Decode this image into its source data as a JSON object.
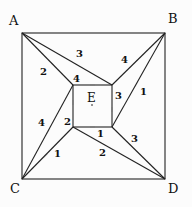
{
  "diagram": {
    "vertices": {
      "A": {
        "label": "A",
        "x": 22,
        "y": 33
      },
      "B": {
        "label": "B",
        "x": 165,
        "y": 33
      },
      "C": {
        "label": "C",
        "x": 22,
        "y": 179
      },
      "D": {
        "label": "D",
        "x": 165,
        "y": 179
      },
      "TL": {
        "x": 73,
        "y": 85
      },
      "TR": {
        "x": 112,
        "y": 85
      },
      "BL": {
        "x": 73,
        "y": 127
      },
      "BR": {
        "x": 112,
        "y": 127
      }
    },
    "center_label": "E",
    "edges": [
      {
        "from": "A",
        "to": "TL",
        "label": "2"
      },
      {
        "from": "TR",
        "to": "A",
        "label": "3"
      },
      {
        "from": "B",
        "to": "TR",
        "label": "4"
      },
      {
        "from": "BR",
        "to": "B",
        "label": "1"
      },
      {
        "from": "TL",
        "to": "C",
        "label": "4"
      },
      {
        "from": "C",
        "to": "BL",
        "label": "1"
      },
      {
        "from": "BL",
        "to": "D",
        "label": "2"
      },
      {
        "from": "D",
        "to": "BR",
        "label": "3"
      },
      {
        "from": "TR",
        "to": "TL",
        "label": "4"
      },
      {
        "from": "TL",
        "to": "BL",
        "label": "2"
      },
      {
        "from": "BL",
        "to": "BR",
        "label": "1"
      },
      {
        "from": "BR",
        "to": "TR",
        "label": "3"
      }
    ],
    "labels": {
      "A": "A",
      "B": "B",
      "C": "C",
      "D": "D",
      "E": "E",
      "a_tl": "2",
      "tr_a": "3",
      "b_tr": "4",
      "br_b": "1",
      "tl_c": "4",
      "c_bl": "1",
      "bl_d": "2",
      "d_br": "3",
      "inner_top": "4",
      "inner_left": "2",
      "inner_bottom": "1",
      "inner_right": "3"
    }
  }
}
